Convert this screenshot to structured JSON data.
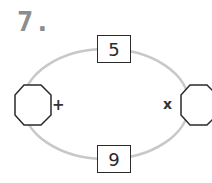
{
  "problem": {
    "number_label": "7.",
    "top_box_value": "5",
    "bottom_box_value": "9",
    "left_operator": "+",
    "right_operator": "x",
    "left_answer_value": "",
    "right_answer_value": ""
  },
  "colors": {
    "ring": "#c8c8c8",
    "outline": "#2a2a2a",
    "number_label": "#8c8c8c"
  }
}
